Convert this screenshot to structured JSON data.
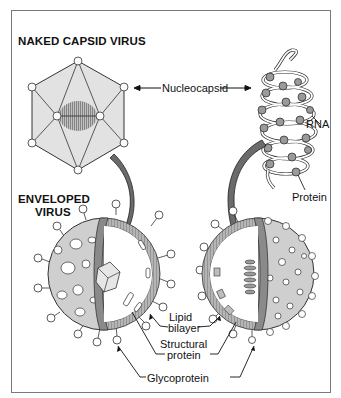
{
  "diagram": {
    "titles": {
      "naked": "NAKED CAPSID VIRUS",
      "enveloped_line1": "ENVELOPED",
      "enveloped_line2": "VIRUS"
    },
    "labels": {
      "nucleocapsid": "Nucleocapsid",
      "rna": "RNA",
      "protein": "Protein",
      "lipid_line1": "Lipid",
      "lipid_line2": "bilayer",
      "structural_line1": "Structural",
      "structural_line2": "protein",
      "glycoprotein": "Glycoprotein"
    },
    "colors": {
      "capsid_fill": "#e2e2e2",
      "arrow_fill": "#6b6b6b",
      "envelope_fill": "#cfcfcf",
      "protein_ball": "#9a9a9a",
      "outline": "#222222",
      "frame": "#7a7a7a"
    }
  }
}
